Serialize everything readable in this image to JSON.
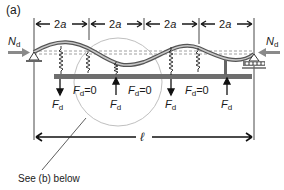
{
  "panel_label": "(a)",
  "spacing_labels": [
    "2a",
    "2a",
    "2a",
    "2a"
  ],
  "axial_force": {
    "symbol": "N",
    "subscript": "d"
  },
  "forces": [
    {
      "symbol": "F",
      "subscript": "d",
      "suffix": ""
    },
    {
      "symbol": "F",
      "subscript": "d",
      "suffix": "=0"
    },
    {
      "symbol": "F",
      "subscript": "d",
      "suffix": ""
    },
    {
      "symbol": "F",
      "subscript": "d",
      "suffix": "=0"
    },
    {
      "symbol": "F",
      "subscript": "d",
      "suffix": ""
    }
  ],
  "length_label": "ℓ",
  "callout": "See (b) below",
  "colors": {
    "beam": "#6e6e6e",
    "ink": "#1a1a1a",
    "grey_arrow": "#8a8a8a",
    "circle": "#b0b0b0"
  }
}
